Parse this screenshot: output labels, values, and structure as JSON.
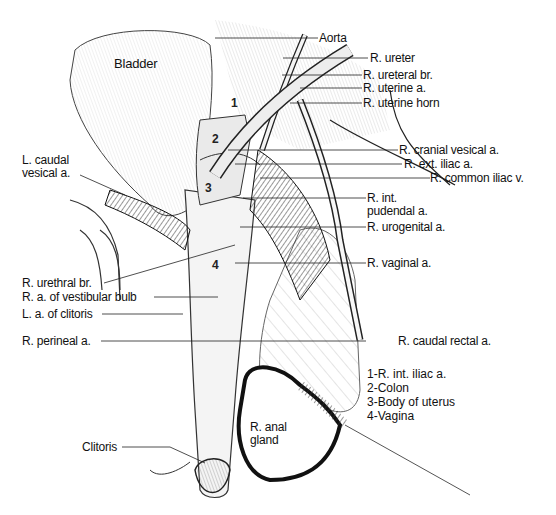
{
  "figure": {
    "structure_labels": {
      "bladder": "Bladder",
      "aorta": "Aorta",
      "r_ureter": "R. ureter",
      "r_ureteral_br": "R. ureteral br.",
      "r_uterine_a": "R. uterine a.",
      "r_uterine_horn": "R. uterine horn",
      "r_cranial_vesical_a": "R. cranial vesical a.",
      "r_ext_iliac_a": "R. ext. iliac a.",
      "r_common_iliac_v": "R. common iliac v.",
      "r_int_pudendal_a_line1": "R. int.",
      "r_int_pudendal_a_line2": "pudendal a.",
      "r_urogenital_a": "R. urogenital a.",
      "r_vaginal_a": "R. vaginal a.",
      "l_caudal_vesical_a_line1": "L. caudal",
      "l_caudal_vesical_a_line2": "vesical a.",
      "r_urethral_br": "R. urethral br.",
      "r_a_of_vestibular_bulb": "R. a. of vestibular bulb",
      "l_a_of_clitoris": "L. a. of clitoris",
      "r_perineal_a": "R. perineal a.",
      "r_caudal_rectal_a": "R. caudal rectal a.",
      "r_anal_gland_line1": "R. anal",
      "r_anal_gland_line2": "gland",
      "clitoris": "Clitoris"
    },
    "markers": {
      "m1": "1",
      "m2": "2",
      "m3": "3",
      "m4": "4"
    },
    "legend": [
      "1-R. int. iliac a.",
      "2-Colon",
      "3-Body of uterus",
      "4-Vagina"
    ]
  }
}
